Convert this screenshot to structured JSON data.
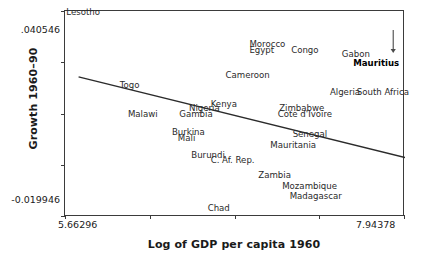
{
  "chart_data": {
    "type": "scatter",
    "title": "",
    "xlabel": "Log of GDP per capita 1960",
    "ylabel": "Growth 1960–90",
    "xlim": [
      5.66296,
      7.94378
    ],
    "ylim": [
      -0.019946,
      0.040546
    ],
    "xticks": [
      "5.66296",
      "",
      "",
      "",
      "7.94378"
    ],
    "yticks": [
      ".040546",
      "",
      "",
      "",
      "-0.019946"
    ],
    "grid": false,
    "legend": null,
    "x_tick_labels": {
      "left": "5.66296",
      "right": "7.94378"
    },
    "y_tick_labels": {
      "top": ".040546",
      "bottom": "-0.019946"
    },
    "n_xticks": 5,
    "n_yticks": 5,
    "points": [
      {
        "label": "Lesotho",
        "x": 5.672,
        "y": 0.04,
        "highlight": false
      },
      {
        "label": "Morocco",
        "x": 6.9,
        "y": 0.0306,
        "highlight": false
      },
      {
        "label": "Egypt",
        "x": 6.9,
        "y": 0.0288,
        "highlight": false
      },
      {
        "label": "Congo",
        "x": 7.18,
        "y": 0.0288,
        "highlight": false
      },
      {
        "label": "Gabon",
        "x": 7.52,
        "y": 0.0276,
        "highlight": false
      },
      {
        "label": "Mauritius",
        "x": 7.905,
        "y": 0.025,
        "highlight": true
      },
      {
        "label": "Cameroon",
        "x": 6.74,
        "y": 0.0215,
        "highlight": false
      },
      {
        "label": "Togo",
        "x": 6.03,
        "y": 0.0185,
        "highlight": false
      },
      {
        "label": "Algeria",
        "x": 7.44,
        "y": 0.0165,
        "highlight": false
      },
      {
        "label": "South Africa",
        "x": 7.62,
        "y": 0.0165,
        "highlight": false
      },
      {
        "label": "Kenya",
        "x": 6.64,
        "y": 0.013,
        "highlight": false
      },
      {
        "label": "Nigeria",
        "x": 6.495,
        "y": 0.0118,
        "highlight": false
      },
      {
        "label": "Zimbabwe",
        "x": 7.1,
        "y": 0.0118,
        "highlight": false
      },
      {
        "label": "Malawi",
        "x": 6.085,
        "y": 0.01,
        "highlight": false
      },
      {
        "label": "Gambia",
        "x": 6.43,
        "y": 0.01,
        "highlight": false
      },
      {
        "label": "Cote d'Ivoire",
        "x": 7.09,
        "y": 0.01,
        "highlight": false
      },
      {
        "label": "Burkina",
        "x": 6.38,
        "y": 0.0048,
        "highlight": false
      },
      {
        "label": "Mali",
        "x": 6.42,
        "y": 0.003,
        "highlight": false
      },
      {
        "label": "Senegal",
        "x": 7.19,
        "y": 0.0042,
        "highlight": false
      },
      {
        "label": "Mauritania",
        "x": 7.04,
        "y": 0.001,
        "highlight": false
      },
      {
        "label": "Burundi",
        "x": 6.51,
        "y": -0.002,
        "highlight": false
      },
      {
        "label": "C. Af. Rep.",
        "x": 6.64,
        "y": -0.0036,
        "highlight": false
      },
      {
        "label": "Zambia",
        "x": 6.96,
        "y": -0.008,
        "highlight": false
      },
      {
        "label": "Mozambique",
        "x": 7.12,
        "y": -0.011,
        "highlight": false
      },
      {
        "label": "Madagascar",
        "x": 7.17,
        "y": -0.014,
        "highlight": false
      },
      {
        "label": "Chad",
        "x": 6.62,
        "y": -0.0175,
        "highlight": false
      }
    ],
    "fit_line": {
      "name": "regression-line",
      "x_start": 5.754,
      "y_start": 0.0212,
      "x_end": 7.944,
      "y_end": -0.0025,
      "color": "#2b2b2b"
    },
    "annotations": [
      {
        "name": "mauritius-arrow",
        "target_label": "Mauritius",
        "direction": "down",
        "color": "#4a4a4a"
      }
    ]
  }
}
